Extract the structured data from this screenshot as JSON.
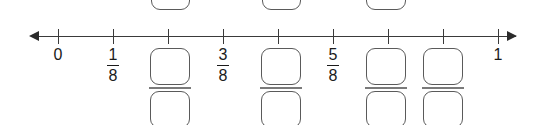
{
  "worksheet": {
    "kind": "fraction-number-line-exercise",
    "numberline": {
      "start_value": "0",
      "end_value": "1",
      "divisions": 8,
      "left_arrow": "left-arrow",
      "right_arrow": "right-arrow",
      "ticks": [
        {
          "index": 0,
          "x": 58,
          "label": "0",
          "type": "whole"
        },
        {
          "index": 1,
          "x": 113,
          "label": "1/8",
          "type": "fraction",
          "num": "1",
          "den": "8"
        },
        {
          "index": 2,
          "x": 168,
          "label": "",
          "type": "blank"
        },
        {
          "index": 3,
          "x": 223,
          "label": "3/8",
          "type": "fraction",
          "num": "3",
          "den": "8"
        },
        {
          "index": 4,
          "x": 278,
          "label": "",
          "type": "blank"
        },
        {
          "index": 5,
          "x": 333,
          "label": "5/8",
          "type": "fraction",
          "num": "5",
          "den": "8"
        },
        {
          "index": 6,
          "x": 388,
          "label": "",
          "type": "blank"
        },
        {
          "index": 7,
          "x": 443,
          "label": "",
          "type": "blank"
        },
        {
          "index": 8,
          "x": 498,
          "label": "1",
          "type": "whole"
        }
      ],
      "visible_labels": [
        {
          "text": "0",
          "x": 58
        },
        {
          "text": "1",
          "x": 498
        }
      ],
      "visible_fractions": [
        {
          "num": "1",
          "den": "8",
          "x": 113
        },
        {
          "num": "3",
          "den": "8",
          "x": 223
        },
        {
          "num": "5",
          "den": "8",
          "x": 333
        }
      ]
    },
    "top_partial_boxes": [
      {
        "id": "top-box-1",
        "x": 151,
        "width": 39,
        "value": ""
      },
      {
        "id": "top-box-2",
        "x": 262,
        "width": 39,
        "value": ""
      },
      {
        "id": "top-box-3",
        "x": 366,
        "width": 40,
        "value": ""
      }
    ],
    "answer_fractions": [
      {
        "id": "answer-fraction-1",
        "x": 150,
        "width": 40,
        "numerator": "",
        "denominator": ""
      },
      {
        "id": "answer-fraction-2",
        "x": 261,
        "width": 40,
        "numerator": "",
        "denominator": ""
      },
      {
        "id": "answer-fraction-3",
        "x": 366,
        "width": 40,
        "numerator": "",
        "denominator": ""
      },
      {
        "id": "answer-fraction-4",
        "x": 423,
        "width": 40,
        "numerator": "",
        "denominator": ""
      }
    ],
    "colors": {
      "line": "#3a3a3a",
      "box_border": "#5a5a5a",
      "fraction_bar": "#7a7a7a",
      "text": "#1a1a1a",
      "background": "#ffffff"
    }
  }
}
